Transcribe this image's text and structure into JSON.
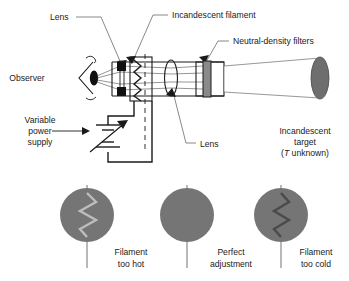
{
  "figure": {
    "colors": {
      "line": "#1a1a1a",
      "leader": "#6b6b6b",
      "disc_gray": "#757575",
      "filament_hot": "#bdbdbd",
      "filament_cold": "#4a4a4a",
      "filter_gray": "#8a8a8a",
      "target_gray": "#6e6e6e",
      "background": "#ffffff"
    }
  },
  "labels": {
    "lens_top": "Lens",
    "incandescent_filament": "Incandescent filament",
    "neutral_density_filters": "Neutral-density filters",
    "observer": "Observer",
    "lens_bottom": "Lens",
    "variable_power_supply": {
      "line1": "Variable",
      "line2": "power",
      "line3": "supply"
    },
    "incandescent_target": {
      "line1": "Incandescent",
      "line2": "target",
      "line3_symbol": "T",
      "line3_rest": " unknown)",
      "line3_open": "("
    }
  },
  "views": [
    {
      "id": "filament-too-hot",
      "caption_line1": "Filament",
      "caption_line2": "too hot",
      "filament_state": "bright",
      "filament_visible": true
    },
    {
      "id": "perfect-adjustment",
      "caption_line1": "Perfect",
      "caption_line2": "adjustment",
      "filament_state": "matched",
      "filament_visible": false
    },
    {
      "id": "filament-too-cold",
      "caption_line1": "Filament",
      "caption_line2": "too cold",
      "filament_state": "dark",
      "filament_visible": true
    }
  ]
}
